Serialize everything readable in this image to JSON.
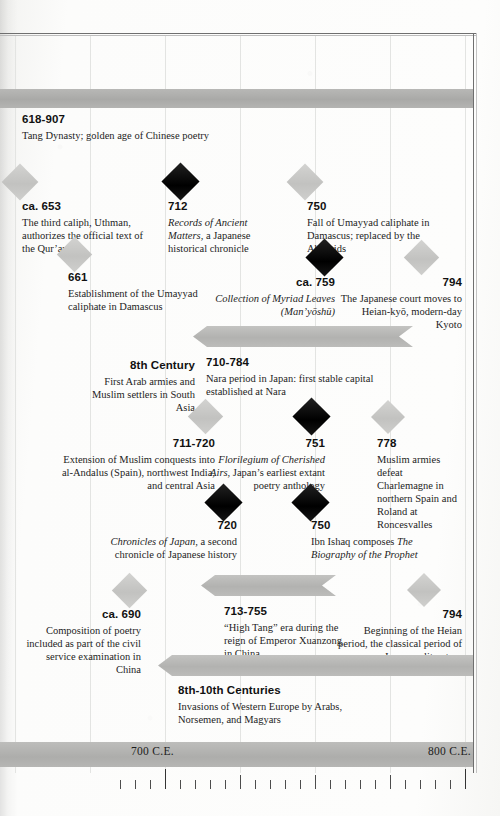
{
  "axis": {
    "labels": [
      {
        "text": "700 C.E.",
        "year": 700
      },
      {
        "text": "800 C.E.",
        "year": 800
      }
    ],
    "range": [
      684,
      810
    ],
    "tick_interval_years": 5,
    "major_tick_interval_years": 25,
    "px_per_century": 300,
    "century_origin_px": 165
  },
  "colors": {
    "paper": "#fbfbfa",
    "band_gray": "#adadab",
    "marker_dark": "#000000",
    "marker_light": "#c8c8c6",
    "text": "#1a1a1a",
    "rule": "#6f6f6f"
  },
  "bands": [
    {
      "id": "tang-dynasty",
      "years": "618-907",
      "desc": "Tang Dynasty; golden age of Chinese poetry"
    },
    {
      "id": "nara-period",
      "years": "710-784",
      "desc": "Nara period in Japan: first stable capital established at Nara"
    },
    {
      "id": "high-tang",
      "years": "713-755",
      "desc": "“High Tang” era during the reign of Emperor Xuanzong in China"
    },
    {
      "id": "invasions-western-europe",
      "years": "8th-10th Centuries",
      "desc": "Invasions of Western Europe by Arabs, Norsemen, and Magyars"
    }
  ],
  "events": [
    {
      "id": "uthman-quran",
      "years": "ca. 653",
      "desc": "The third caliph, Uthman, authorizes the official text of the Qur’an",
      "marker": "light",
      "align": "left"
    },
    {
      "id": "kojiki",
      "years": "712",
      "desc_italic": "Records of Ancient Matters",
      "desc": ", a Japanese historical chronicle",
      "marker": "dark",
      "align": "left"
    },
    {
      "id": "fall-umayyad",
      "years": "750",
      "desc": "Fall of Umayyad caliphate in Damascus; replaced by the Abbasids",
      "marker": "light",
      "align": "left"
    },
    {
      "id": "umayyad-established",
      "years": "661",
      "desc": "Establishment of the Umayyad caliphate in Damascus",
      "marker": "light",
      "align": "left"
    },
    {
      "id": "manyoshu",
      "years": "ca. 759",
      "desc_italic": "Collection of Myriad Leaves (Man’yōshū)",
      "desc": "",
      "marker": "dark",
      "align": "right"
    },
    {
      "id": "heian-kyo-move",
      "years": "794",
      "desc": "The Japanese court moves to Heian-kyō, modern-day Kyoto",
      "marker": "light",
      "align": "right"
    },
    {
      "id": "first-arab-armies",
      "years": "8th Century",
      "desc": "First Arab armies and Muslim settlers in South Asia",
      "marker": "light",
      "align": "right"
    },
    {
      "id": "muslim-conquests-andalus",
      "years": "711-720",
      "desc": "Extension of Muslim conquests into al-Andalus (Spain), northwest India, and central Asia",
      "marker": "light",
      "align": "right"
    },
    {
      "id": "kaifuso",
      "years": "751",
      "desc_italic": "Florilegium of Cherished Airs",
      "desc": ", Japan’s earliest extant poetry anthology",
      "marker": "dark",
      "align": "right"
    },
    {
      "id": "roncesvalles",
      "years": "778",
      "desc": "Muslim armies defeat Charlemagne in northern Spain and Roland at Roncesvalles",
      "marker": "light",
      "align": "left"
    },
    {
      "id": "nihon-shoki",
      "years": "720",
      "desc_italic": "Chronicles of Japan",
      "desc": ", a second chronicle of Japanese history",
      "marker": "dark",
      "align": "right"
    },
    {
      "id": "ibn-ishaq",
      "years": "750",
      "desc": "Ibn Ishaq composes ",
      "desc_italic_after": "The Biography of the Prophet",
      "marker": "dark",
      "align": "left"
    },
    {
      "id": "poetry-civil-service",
      "years": "ca. 690",
      "desc": "Composition of poetry included as part of the civil service examination in China",
      "marker": "light",
      "align": "right"
    },
    {
      "id": "heian-period-begins",
      "years": "794",
      "desc": "Beginning of the Heian period, the classical period of Japanese literature",
      "marker": "light",
      "align": "right"
    }
  ]
}
